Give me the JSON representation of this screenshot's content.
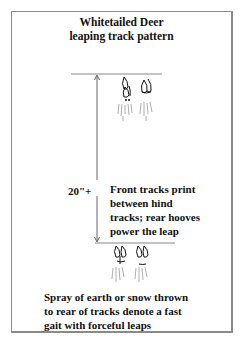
{
  "title": {
    "line1": "Whitetailed Deer",
    "line2": "leaping track pattern"
  },
  "measurement": {
    "label": "20\"+"
  },
  "annotations": {
    "front_tracks": [
      "Front tracks print",
      "between hind",
      "tracks; rear hooves",
      "power the leap"
    ],
    "spray": [
      "Spray of earth or snow thrown",
      "to rear of tracks denote a fast",
      "gait with forceful leaps"
    ]
  },
  "colors": {
    "ink": "#111111",
    "frame": "#8a8a8a",
    "line": "#888888"
  }
}
